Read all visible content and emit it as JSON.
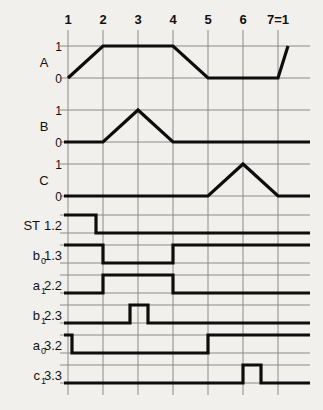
{
  "figure": {
    "background_color": "#f2f0ec",
    "line_color": "#0d0d0d",
    "grid_color": "#8a8a8a"
  },
  "columns": {
    "labels": [
      "1",
      "2",
      "3",
      "4",
      "5",
      "6",
      "7=1"
    ],
    "x_positions": [
      68,
      103,
      138,
      173,
      208,
      243,
      278
    ],
    "right_edge": 310
  },
  "analog_signals": [
    {
      "name": "A",
      "level_labels": [
        "1",
        "0"
      ],
      "y_one": 46,
      "y_zero": 78,
      "points": [
        [
          68,
          0
        ],
        [
          103,
          1
        ],
        [
          173,
          1
        ],
        [
          208,
          0
        ],
        [
          278,
          0
        ],
        [
          288,
          1
        ]
      ]
    },
    {
      "name": "B",
      "level_labels": [
        "1",
        "0"
      ],
      "y_one": 110,
      "y_zero": 142,
      "points": [
        [
          64,
          0
        ],
        [
          103,
          0
        ],
        [
          138,
          1
        ],
        [
          173,
          0
        ],
        [
          310,
          0
        ]
      ]
    },
    {
      "name": "C",
      "level_labels": [
        "1",
        "0"
      ],
      "y_one": 164,
      "y_zero": 196,
      "points": [
        [
          64,
          0
        ],
        [
          208,
          0
        ],
        [
          243,
          1
        ],
        [
          278,
          0
        ],
        [
          310,
          0
        ]
      ]
    }
  ],
  "digital_signals": [
    {
      "name": "ST",
      "sub": "",
      "address": "1.2",
      "y_high": 215,
      "y_low": 233,
      "segments": [
        [
          64,
          1
        ],
        [
          96,
          1
        ],
        [
          96,
          0
        ],
        [
          310,
          0
        ]
      ],
      "drawn_to": 96
    },
    {
      "name": "b",
      "sub": "0",
      "address": "1.3",
      "y_high": 245,
      "y_low": 263,
      "segments": [
        [
          64,
          1
        ],
        [
          103,
          1
        ],
        [
          103,
          0
        ],
        [
          173,
          0
        ],
        [
          173,
          1
        ],
        [
          310,
          1
        ]
      ]
    },
    {
      "name": "a",
      "sub": "1",
      "address": "2.2",
      "y_high": 275,
      "y_low": 293,
      "segments": [
        [
          64,
          0
        ],
        [
          103,
          0
        ],
        [
          103,
          1
        ],
        [
          173,
          1
        ],
        [
          173,
          0
        ],
        [
          310,
          0
        ]
      ]
    },
    {
      "name": "b",
      "sub": "1",
      "address": "2.3",
      "y_high": 305,
      "y_low": 323,
      "segments": [
        [
          64,
          0
        ],
        [
          130,
          0
        ],
        [
          130,
          1
        ],
        [
          148,
          1
        ],
        [
          148,
          0
        ],
        [
          310,
          0
        ]
      ]
    },
    {
      "name": "a",
      "sub": "0",
      "address": "3.2",
      "y_high": 335,
      "y_low": 353,
      "segments": [
        [
          64,
          1
        ],
        [
          72,
          1
        ],
        [
          72,
          0
        ],
        [
          208,
          0
        ],
        [
          208,
          1
        ],
        [
          310,
          1
        ]
      ]
    },
    {
      "name": "c",
      "sub": "1",
      "address": "3.3",
      "y_high": 365,
      "y_low": 383,
      "segments": [
        [
          64,
          0
        ],
        [
          243,
          0
        ],
        [
          243,
          1
        ],
        [
          261,
          1
        ],
        [
          261,
          0
        ],
        [
          310,
          0
        ]
      ]
    }
  ],
  "chart_data": {
    "type": "line",
    "title": "",
    "xlabel": "",
    "ylabel": "",
    "categories": [
      "1",
      "2",
      "3",
      "4",
      "5",
      "6",
      "7=1"
    ],
    "grid": true,
    "legend": "none",
    "series": [
      {
        "name": "A",
        "kind": "analog-trapezoid",
        "address": "",
        "x": [
          1,
          2,
          4,
          5,
          7,
          7.3
        ],
        "values": [
          0,
          1,
          1,
          0,
          0,
          1
        ]
      },
      {
        "name": "B",
        "kind": "analog-triangle",
        "address": "",
        "x": [
          1,
          2,
          3,
          4,
          7
        ],
        "values": [
          0,
          0,
          1,
          0,
          0
        ]
      },
      {
        "name": "C",
        "kind": "analog-triangle",
        "address": "",
        "x": [
          1,
          5,
          6,
          7
        ],
        "values": [
          0,
          0,
          1,
          0
        ]
      },
      {
        "name": "ST",
        "kind": "digital",
        "address": "1.2",
        "x": [
          1,
          1.8,
          1.8,
          7
        ],
        "values": [
          1,
          1,
          0,
          0
        ]
      },
      {
        "name": "b0",
        "kind": "digital",
        "address": "1.3",
        "x": [
          1,
          2,
          2,
          4,
          4,
          7
        ],
        "values": [
          1,
          1,
          0,
          0,
          1,
          1
        ]
      },
      {
        "name": "a1",
        "kind": "digital",
        "address": "2.2",
        "x": [
          1,
          2,
          2,
          4,
          4,
          7
        ],
        "values": [
          0,
          0,
          1,
          1,
          0,
          0
        ]
      },
      {
        "name": "b1",
        "kind": "digital",
        "address": "2.3",
        "x": [
          1,
          2.8,
          2.8,
          3.3,
          3.3,
          7
        ],
        "values": [
          0,
          0,
          1,
          1,
          0,
          0
        ]
      },
      {
        "name": "a0",
        "kind": "digital",
        "address": "3.2",
        "x": [
          1,
          1.1,
          1.1,
          5,
          5,
          7
        ],
        "values": [
          1,
          1,
          0,
          0,
          1,
          1
        ]
      },
      {
        "name": "c1",
        "kind": "digital",
        "address": "3.3",
        "x": [
          1,
          6,
          6,
          6.5,
          6.5,
          7
        ],
        "values": [
          0,
          0,
          1,
          1,
          0,
          0
        ]
      }
    ]
  }
}
